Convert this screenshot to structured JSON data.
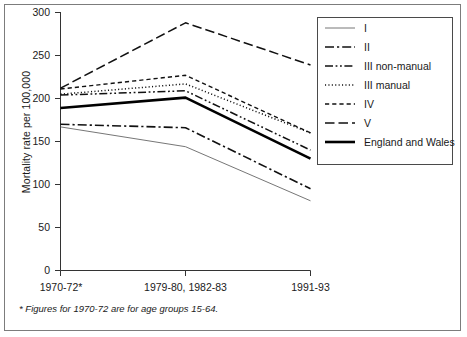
{
  "chart_data": {
    "type": "line",
    "title": "",
    "xlabel": "",
    "ylabel": "Mortality rate per 100,000",
    "ylim": [
      0,
      300
    ],
    "yticks": [
      0,
      50,
      100,
      150,
      200,
      250,
      300
    ],
    "grid": false,
    "legend_position": "right",
    "categories": [
      "1970-72*",
      "1979-80, 1982-83",
      "1991-93"
    ],
    "series": [
      {
        "name": "I",
        "values": [
          167,
          144,
          81
        ],
        "style": "solid-thin",
        "color": "#555555"
      },
      {
        "name": "II",
        "values": [
          170,
          166,
          95
        ],
        "style": "dash-dot",
        "color": "#111111"
      },
      {
        "name": "III non-manual",
        "values": [
          204,
          209,
          140
        ],
        "style": "dash-dot-dot",
        "color": "#111111"
      },
      {
        "name": "III manual",
        "values": [
          205,
          217,
          160
        ],
        "style": "dotted",
        "color": "#111111"
      },
      {
        "name": "IV",
        "values": [
          211,
          227,
          160
        ],
        "style": "short-dash",
        "color": "#111111"
      },
      {
        "name": "V",
        "values": [
          212,
          288,
          239
        ],
        "style": "long-dash",
        "color": "#111111"
      },
      {
        "name": "England and Wales",
        "values": [
          189,
          201,
          130
        ],
        "style": "solid-thick",
        "color": "#000000"
      }
    ],
    "footnote": "* Figures for 1970-72 are for age groups 15-64."
  },
  "axis": {
    "y_title": "Mortality rate per 100,000",
    "y_ticks": [
      "300",
      "250",
      "200",
      "150",
      "100",
      "50",
      "0"
    ],
    "x_ticks": [
      "1970-72*",
      "1979-80, 1982-83",
      "1991-93"
    ]
  },
  "legend": {
    "items": [
      {
        "label": "I"
      },
      {
        "label": "II"
      },
      {
        "label": "III non-manual"
      },
      {
        "label": "III manual"
      },
      {
        "label": "IV"
      },
      {
        "label": "V"
      },
      {
        "label": "England and Wales"
      }
    ]
  },
  "footnote": {
    "text": "* Figures for 1970-72 are for age groups 15-64."
  }
}
